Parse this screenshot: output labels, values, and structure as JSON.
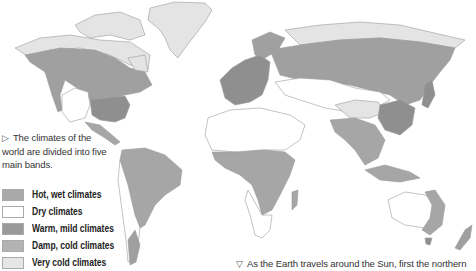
{
  "caption_main": {
    "marker": "▷",
    "text": "The climates of the world are divided into five main bands."
  },
  "caption_bottom": {
    "marker": "▽",
    "text": "As the Earth travels around the Sun, first the northern"
  },
  "legend": {
    "items": [
      {
        "label": "Hot, wet climates",
        "color": "#a9a9a9"
      },
      {
        "label": "Dry climates",
        "color": "#ffffff"
      },
      {
        "label": "Warm, mild climates",
        "color": "#9a9a9a"
      },
      {
        "label": "Damp, cold climates",
        "color": "#b3b3b3"
      },
      {
        "label": "Very cold climates",
        "color": "#e6e6e6"
      }
    ]
  },
  "map": {
    "colors": {
      "hot_wet": "#a6a6a6",
      "dry": "#ffffff",
      "warm_mild": "#8f8f8f",
      "damp_cold": "#a0a0a0",
      "very_cold": "#e4e4e4",
      "outline": "#9a9a9a"
    }
  }
}
